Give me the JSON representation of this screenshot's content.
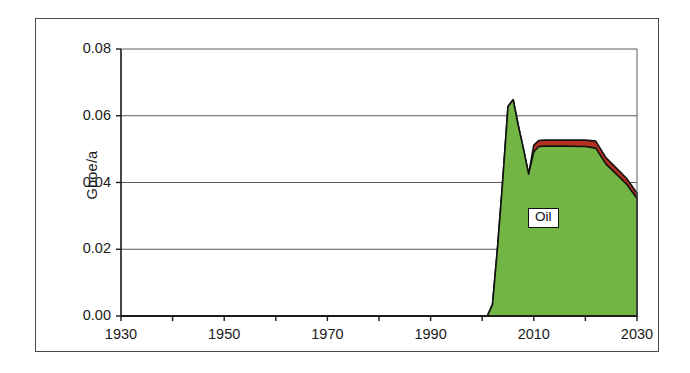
{
  "figure": {
    "background_color": "#ffffff",
    "frame_color": "#4a4a4a"
  },
  "chart_data": {
    "type": "area",
    "title": "",
    "subtitle": "",
    "xlabel": "",
    "ylabel": "Gboe/a",
    "xlim": [
      1930,
      2030
    ],
    "ylim": [
      0.0,
      0.08
    ],
    "grid": true,
    "grid_axis": "y",
    "legend_position": "inline-annotation",
    "stacked": true,
    "x_tick_labels": [
      "1930",
      "1950",
      "1970",
      "1990",
      "2010",
      "2030"
    ],
    "x_tick_values": [
      1930,
      1950,
      1970,
      1990,
      2010,
      2030
    ],
    "x_minor_tick_values": [
      1940,
      1960,
      1980,
      2000,
      2020
    ],
    "y_tick_labels": [
      "0.00",
      "0.02",
      "0.04",
      "0.06",
      "0.08"
    ],
    "y_tick_values": [
      0.0,
      0.02,
      0.04,
      0.06,
      0.08
    ],
    "annotations": [
      {
        "text": "Oil",
        "x": 2012,
        "y": 0.029,
        "boxed": true
      }
    ],
    "series": [
      {
        "name": "Oil",
        "color": "#72b544",
        "edge_color": "#111111",
        "x": [
          1930,
          2001,
          2002,
          2003,
          2004,
          2005,
          2006,
          2007,
          2008,
          2009,
          2010,
          2011,
          2012,
          2016,
          2020,
          2022,
          2024,
          2026,
          2028,
          2030
        ],
        "values": [
          0.0,
          0.0,
          0.0035,
          0.021,
          0.041,
          0.0628,
          0.0648,
          0.057,
          0.05,
          0.0425,
          0.0492,
          0.0508,
          0.0509,
          0.0509,
          0.0508,
          0.0503,
          0.0455,
          0.0425,
          0.0395,
          0.0352
        ]
      },
      {
        "name": "Condensate",
        "color": "#b4301f",
        "edge_color": "#111111",
        "x": [
          1930,
          2001,
          2002,
          2003,
          2004,
          2005,
          2006,
          2007,
          2008,
          2009,
          2010,
          2011,
          2012,
          2016,
          2020,
          2022,
          2024,
          2026,
          2028,
          2030
        ],
        "values": [
          0.0,
          0.0,
          0.0035,
          0.021,
          0.041,
          0.0628,
          0.0648,
          0.057,
          0.05,
          0.0425,
          0.0512,
          0.0526,
          0.0527,
          0.0527,
          0.0527,
          0.0524,
          0.0474,
          0.0443,
          0.0412,
          0.0368
        ]
      }
    ]
  }
}
